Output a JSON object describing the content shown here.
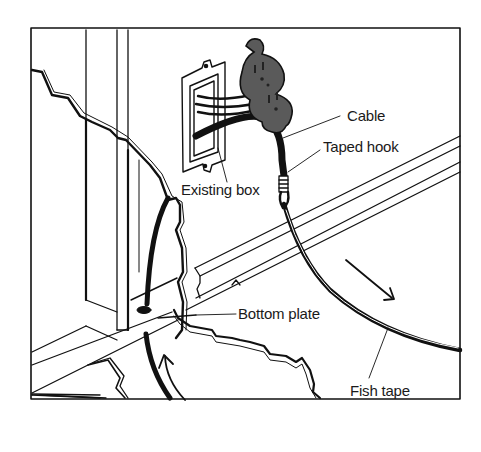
{
  "diagram": {
    "labels": {
      "cable": "Cable",
      "taped_hook": "Taped hook",
      "existing_box": "Existing box",
      "bottom_plate": "Bottom plate",
      "fish_tape": "Fish tape"
    },
    "components": [
      "wall-frame",
      "wall-studs",
      "torn-drywall",
      "existing-electrical-box",
      "duplex-receptacle",
      "cable",
      "taped-hook",
      "fish-tape",
      "bottom-plate",
      "floor-joist",
      "direction-arrows"
    ],
    "colors": {
      "ink": "#111111",
      "background": "#ffffff",
      "receptacle": "#5a5a5a"
    }
  }
}
